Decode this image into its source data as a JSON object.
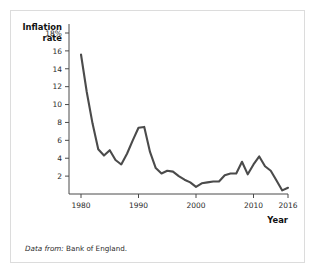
{
  "figure": {
    "source_note_lead": "Data from:",
    "source_note_text": "Bank of England.",
    "border_color": "#dcdcdc",
    "line_color": "#4b4b4b",
    "axis_color": "#4a4a4a"
  },
  "chart_data": {
    "type": "line",
    "title": "",
    "subtitle": "",
    "xlabel": "Year",
    "ylabel_line1": "Inflation",
    "ylabel_line2": "rate",
    "ylabel": "Inflation rate",
    "xlim": [
      1980,
      2016
    ],
    "ylim": [
      0,
      18
    ],
    "grid": false,
    "legend": "none",
    "xticks": [
      1980,
      1990,
      2000,
      2010,
      2016
    ],
    "xticklabels": [
      "1980",
      "1990",
      "2000",
      "2010",
      "2016"
    ],
    "yticks": [
      2,
      4,
      6,
      8,
      10,
      12,
      14,
      16,
      18
    ],
    "yticklabels": [
      "2",
      "4",
      "6",
      "8",
      "10",
      "12",
      "14",
      "16",
      "18%"
    ],
    "series": [
      {
        "name": "UK inflation rate",
        "x": [
          1980,
          1981,
          1982,
          1983,
          1984,
          1985,
          1986,
          1987,
          1988,
          1989,
          1990,
          1991,
          1992,
          1993,
          1994,
          1995,
          1996,
          1997,
          1998,
          1999,
          2000,
          2001,
          2002,
          2003,
          2004,
          2005,
          2006,
          2007,
          2008,
          2009,
          2010,
          2011,
          2012,
          2013,
          2014,
          2015,
          2016
        ],
        "values": [
          15.6,
          11.4,
          7.9,
          5.0,
          4.3,
          4.9,
          3.8,
          3.3,
          4.5,
          6.0,
          7.4,
          7.5,
          4.7,
          2.9,
          2.3,
          2.6,
          2.5,
          2.0,
          1.6,
          1.3,
          0.8,
          1.2,
          1.3,
          1.4,
          1.4,
          2.1,
          2.3,
          2.3,
          3.6,
          2.2,
          3.3,
          4.2,
          3.1,
          2.6,
          1.5,
          0.4,
          0.7
        ]
      }
    ]
  }
}
